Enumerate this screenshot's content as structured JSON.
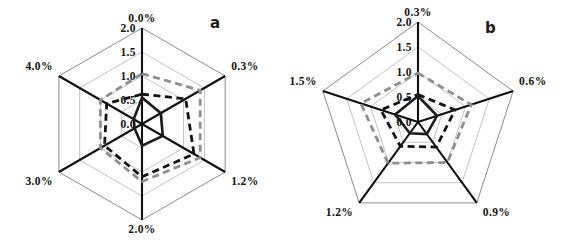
{
  "figure": {
    "background": "#ffffff",
    "width": 570,
    "height": 248
  },
  "panels": [
    {
      "id": "a",
      "letter": "a",
      "shape": "hexagon",
      "axis_ticks": [
        "2.0",
        "1.5",
        "1.0",
        "0.5",
        "0.0"
      ],
      "categories": [
        "0.0%",
        "0.3%",
        "1.2%",
        "2.0%",
        "3.0%",
        "4.0%"
      ]
    },
    {
      "id": "b",
      "letter": "b",
      "shape": "pentagon",
      "axis_ticks": [
        "2.0",
        "1.5",
        "1.0",
        "0.5",
        "0.0"
      ],
      "categories": [
        "0.3%",
        "0.6%",
        "0.9%",
        "1.2%",
        "1.5%"
      ]
    }
  ],
  "chart_data": [
    {
      "type": "line",
      "subtype": "radar",
      "title": "a",
      "panel": "a",
      "categories": [
        "0.0%",
        "0.3%",
        "1.2%",
        "2.0%",
        "3.0%",
        "4.0%"
      ],
      "axis_ticks": [
        0.0,
        0.5,
        1.0,
        1.5,
        2.0
      ],
      "ylim": [
        0,
        2.0
      ],
      "grid": true,
      "legend": "none",
      "xlabel": "",
      "ylabel": "",
      "series": [
        {
          "name": "series-1-solid-dark",
          "style": "solid",
          "color": "#1c1c1c",
          "values": [
            0.55,
            0.45,
            0.5,
            0.45,
            0.18,
            0.2
          ]
        },
        {
          "name": "series-2-dashed-black",
          "style": "dashed",
          "color": "#131313",
          "values": [
            0.62,
            1.05,
            1.25,
            1.1,
            0.9,
            0.85
          ]
        },
        {
          "name": "series-3-dashed-gray",
          "style": "dashed",
          "color": "#8f8f8f",
          "values": [
            1.05,
            1.4,
            1.4,
            1.2,
            1.0,
            1.0
          ]
        }
      ]
    },
    {
      "type": "line",
      "subtype": "radar",
      "title": "b",
      "panel": "b",
      "categories": [
        "0.3%",
        "0.6%",
        "0.9%",
        "1.2%",
        "1.5%"
      ],
      "axis_ticks": [
        0.0,
        0.5,
        1.0,
        1.5,
        2.0
      ],
      "ylim": [
        0,
        2.0
      ],
      "grid": true,
      "legend": "none",
      "xlabel": "",
      "ylabel": "",
      "series": [
        {
          "name": "series-1-solid-dark",
          "style": "solid",
          "color": "#1c1c1c",
          "values": [
            0.52,
            0.4,
            0.3,
            0.28,
            0.48
          ]
        },
        {
          "name": "series-2-dashed-black",
          "style": "dashed",
          "color": "#131313",
          "values": [
            0.55,
            0.78,
            0.62,
            0.6,
            0.78
          ]
        },
        {
          "name": "series-3-dashed-gray",
          "style": "dashed",
          "color": "#8f8f8f",
          "values": [
            0.98,
            1.12,
            1.0,
            1.02,
            1.2
          ]
        }
      ]
    }
  ]
}
